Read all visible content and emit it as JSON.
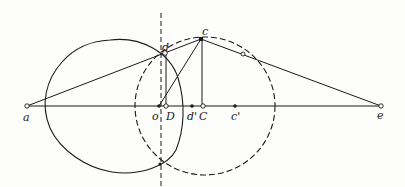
{
  "diagram": {
    "colors": {
      "ink": "#1a1a1a",
      "background": "#fdfdfc",
      "open_point_fill": "#ffffff"
    },
    "labels": {
      "a": "a",
      "o": "o",
      "D": "D",
      "d_prime": "d'",
      "C": "C",
      "c_prime": "c'",
      "e": "e",
      "c": "c",
      "d": "d"
    },
    "points": [
      {
        "name": "a",
        "x": 27,
        "y": 106,
        "style": "open"
      },
      {
        "name": "o",
        "x": 159,
        "y": 106,
        "style": "filled"
      },
      {
        "name": "D",
        "x": 166,
        "y": 106,
        "style": "open"
      },
      {
        "name": "d'",
        "x": 192,
        "y": 106,
        "style": "filled"
      },
      {
        "name": "C",
        "x": 203,
        "y": 106,
        "style": "open"
      },
      {
        "name": "c'",
        "x": 235,
        "y": 106,
        "style": "filled"
      },
      {
        "name": "e",
        "x": 381,
        "y": 106,
        "style": "open"
      },
      {
        "name": "c",
        "x": 201,
        "y": 39,
        "style": "filled"
      },
      {
        "name": "d",
        "x": 165,
        "y": 53,
        "style": "open"
      },
      {
        "name": "tangent-point",
        "x": 243,
        "y": 54,
        "style": "open"
      },
      {
        "name": "intersection-bottom",
        "x": 160,
        "y": 164,
        "style": "filled"
      }
    ],
    "segments": [
      {
        "from": "a",
        "to": "e",
        "style": "solid"
      },
      {
        "from": "a",
        "to": "c",
        "style": "solid"
      },
      {
        "from": "c",
        "to": "e",
        "style": "solid"
      },
      {
        "from": "o",
        "to": "c",
        "style": "solid"
      },
      {
        "from": "c",
        "to": "C",
        "style": "solid"
      },
      {
        "from": "d",
        "to": "D",
        "style": "solid"
      }
    ],
    "curves": [
      {
        "name": "solid-oval",
        "style": "solid"
      },
      {
        "name": "dashed-ellipse",
        "style": "dashed",
        "cx": 205,
        "cy": 106,
        "rx": 70,
        "ry": 69
      },
      {
        "name": "vertical-axis",
        "style": "dashed",
        "x": 161
      }
    ]
  }
}
